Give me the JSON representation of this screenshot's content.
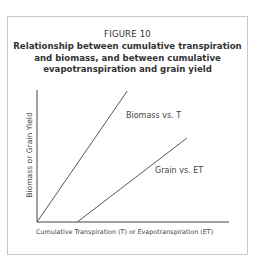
{
  "figure": {
    "label": "FIGURE 10",
    "title": "Relationship between cumulative transpiration and biomass, and between cumulative evapotranspiration and grain yield"
  },
  "chart_data": {
    "type": "line",
    "title": "Relationship between cumulative transpiration and biomass, and between cumulative evapotranspiration and grain yield",
    "xlabel": "Cumulative Transpiration (T) or Evapotranspiration (ET)",
    "ylabel": "Biomass or Grain Yield",
    "grid": false,
    "legend_position": "inline labels",
    "x_range": [
      0,
      100
    ],
    "y_range": [
      0,
      100
    ],
    "series": [
      {
        "name": "Biomass vs. T",
        "x": [
          0,
          47
        ],
        "y": [
          0,
          100
        ]
      },
      {
        "name": "Grain vs. ET",
        "x": [
          21,
          78
        ],
        "y": [
          0,
          64
        ]
      }
    ]
  },
  "colors": {
    "line": "#444444",
    "frame": "#c8c8c8",
    "text": "#333333"
  }
}
